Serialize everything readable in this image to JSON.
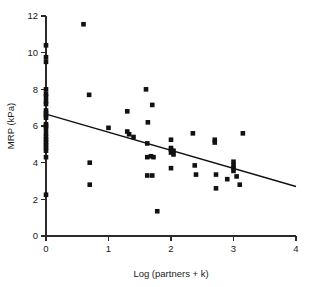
{
  "chart_data": {
    "type": "scatter",
    "title": "",
    "subtitle": "",
    "xlabel": "Log (partners + k)",
    "ylabel": "MRP (kPa)",
    "xlim": [
      0,
      4
    ],
    "ylim": [
      0,
      12
    ],
    "xticks": [
      "0",
      "1",
      "2",
      "3",
      "4"
    ],
    "xtick_values": [
      0,
      1,
      2,
      3,
      4
    ],
    "yticks": [
      "0",
      "2",
      "4",
      "6",
      "8",
      "10",
      "12"
    ],
    "ytick_values": [
      0,
      2,
      4,
      6,
      8,
      10,
      12
    ],
    "grid": false,
    "legend": "none",
    "marker": "filled-square",
    "marker_color": "#111111",
    "series": [
      {
        "name": "observations",
        "x": [
          0.0,
          0.0,
          0.0,
          0.0,
          0.0,
          0.0,
          0.0,
          0.0,
          0.0,
          0.0,
          0.0,
          0.0,
          0.0,
          0.0,
          0.0,
          0.0,
          0.0,
          0.0,
          0.0,
          0.0,
          0.0,
          0.0,
          0.0,
          0.0,
          0.6,
          0.69,
          0.7,
          0.7,
          1.0,
          1.3,
          1.3,
          1.33,
          1.4,
          1.6,
          1.62,
          1.62,
          1.62,
          1.63,
          1.68,
          1.7,
          1.7,
          1.72,
          1.78,
          2.0,
          2.0,
          2.0,
          2.0,
          2.0,
          2.04,
          2.04,
          2.35,
          2.38,
          2.4,
          2.7,
          2.7,
          2.72,
          2.72,
          2.9,
          3.0,
          3.0,
          3.0,
          3.0,
          3.05,
          3.1,
          3.15
        ],
        "y": [
          10.4,
          9.75,
          9.5,
          8.0,
          7.75,
          7.6,
          7.35,
          7.2,
          6.85,
          6.7,
          6.6,
          6.45,
          6.1,
          6.0,
          5.85,
          5.6,
          5.4,
          5.25,
          5.1,
          4.95,
          4.8,
          4.65,
          4.3,
          2.25,
          11.55,
          7.7,
          4.0,
          2.8,
          5.9,
          6.8,
          5.7,
          5.55,
          5.4,
          8.0,
          5.05,
          4.3,
          3.3,
          6.2,
          4.35,
          7.15,
          3.3,
          4.3,
          1.35,
          5.25,
          4.8,
          4.7,
          4.55,
          3.7,
          4.65,
          4.45,
          5.6,
          3.85,
          3.35,
          5.25,
          5.1,
          3.35,
          2.6,
          3.1,
          4.05,
          3.85,
          3.7,
          3.55,
          3.25,
          2.8,
          5.6
        ]
      }
    ],
    "fit_line": {
      "name": "regression-line",
      "x_start": 0.0,
      "y_start": 6.65,
      "x_end": 4.0,
      "y_end": 2.7,
      "slope": -0.9875,
      "intercept": 6.65
    }
  }
}
